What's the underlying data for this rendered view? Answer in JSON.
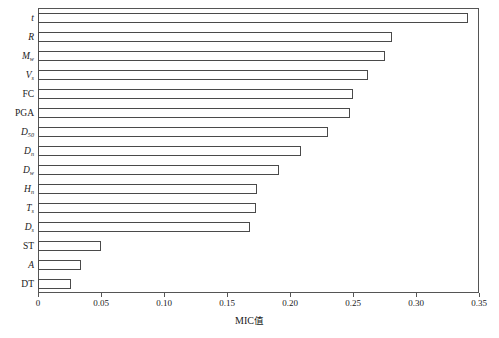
{
  "chart_data": {
    "type": "bar",
    "orientation": "horizontal",
    "title": "",
    "xlabel": "MIC值",
    "ylabel": "",
    "xlim": [
      0,
      0.35
    ],
    "ylim": null,
    "grid": false,
    "legend": null,
    "xticks": [
      "0",
      "0.05",
      "0.10",
      "0.15",
      "0.20",
      "0.25",
      "0.30",
      "0.35"
    ],
    "xtick_values": [
      0,
      0.05,
      0.1,
      0.15,
      0.2,
      0.25,
      0.3,
      0.35
    ],
    "categories": [
      "t",
      "R",
      "Mw",
      "Vs",
      "FC",
      "PGA",
      "D50",
      "Dn",
      "Dw",
      "Hn",
      "Ts",
      "Ds",
      "ST",
      "A",
      "DT"
    ],
    "category_labels": [
      {
        "base": "t",
        "sub": "",
        "italic": true
      },
      {
        "base": "R",
        "sub": "",
        "italic": true
      },
      {
        "base": "M",
        "sub": "w",
        "italic": true
      },
      {
        "base": "V",
        "sub": "s",
        "italic": true
      },
      {
        "base": "FC",
        "sub": "",
        "italic": false
      },
      {
        "base": "PGA",
        "sub": "",
        "italic": false
      },
      {
        "base": "D",
        "sub": "50",
        "italic": true
      },
      {
        "base": "D",
        "sub": "n",
        "italic": true
      },
      {
        "base": "D",
        "sub": "w",
        "italic": true
      },
      {
        "base": "H",
        "sub": "n",
        "italic": true
      },
      {
        "base": "T",
        "sub": "s",
        "italic": true
      },
      {
        "base": "D",
        "sub": "s",
        "italic": true
      },
      {
        "base": "ST",
        "sub": "",
        "italic": false
      },
      {
        "base": "A",
        "sub": "",
        "italic": true
      },
      {
        "base": "DT",
        "sub": "",
        "italic": false
      }
    ],
    "values": [
      0.341,
      0.281,
      0.275,
      0.262,
      0.25,
      0.248,
      0.23,
      0.209,
      0.191,
      0.174,
      0.173,
      0.168,
      0.05,
      0.034,
      0.026
    ],
    "bar_face_color": "#ffffff",
    "bar_edge_color": "#4a4a4a",
    "axis_color": "#555555",
    "background_color": "#ffffff"
  }
}
